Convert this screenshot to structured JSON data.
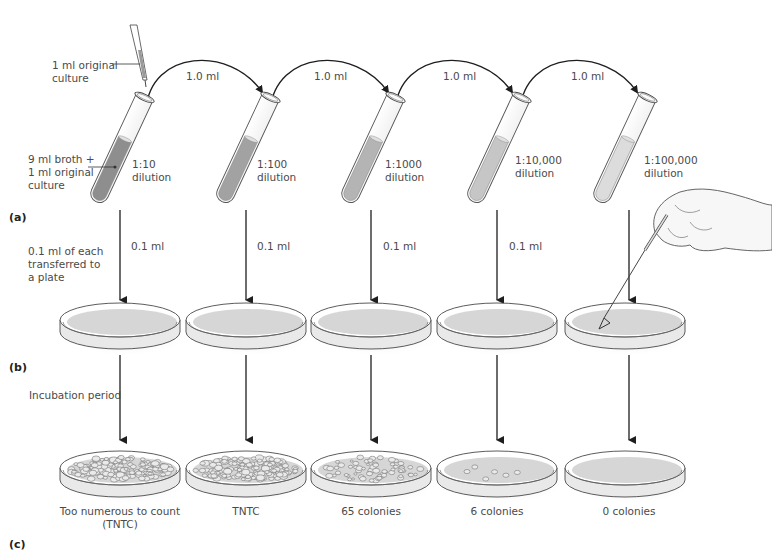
{
  "figure": {
    "parts": [
      "(a)",
      "(b)",
      "(c)"
    ],
    "pipette_label": "1 ml original\nculture",
    "first_tube_label": "9 ml broth +\n1 ml original\nculture",
    "transfer_label": "0.1 ml of each\ntransferred to\na plate",
    "incubation_label": "Incubation period",
    "transfer_volume": "1.0 ml",
    "plate_volume": "0.1 ml"
  },
  "tubes": [
    {
      "dilution": "1:10\ndilution",
      "fill": "#8e8e8e",
      "transfer": "1.0 ml",
      "plate_transfer": "0.1 ml"
    },
    {
      "dilution": "1:100\ndilution",
      "fill": "#a2a2a2",
      "transfer": "1.0 ml",
      "plate_transfer": "0.1 ml"
    },
    {
      "dilution": "1:1000\ndilution",
      "fill": "#b4b4b4",
      "transfer": "1.0 ml",
      "plate_transfer": "0.1 ml"
    },
    {
      "dilution": "1:10,000\ndilution",
      "fill": "#c6c6c6",
      "transfer": "1.0 ml",
      "plate_transfer": "0.1 ml"
    },
    {
      "dilution": "1:100,000\ndilution",
      "fill": "#dcdcdc",
      "plate_transfer": ""
    }
  ],
  "results": [
    {
      "label": "Too numerous to count\n(TNTC)",
      "colonies": "TNTC"
    },
    {
      "label": "TNTC",
      "colonies": "TNTC"
    },
    {
      "label": "65 colonies",
      "colonies": 65
    },
    {
      "label": "6 colonies",
      "colonies": 6
    },
    {
      "label": "0 colonies",
      "colonies": 0
    }
  ],
  "colors": {
    "line": "#1e1e1e",
    "agar": "#d6d6d6",
    "plate_rim": "#4a4a4a",
    "text": "#4a4a4a"
  }
}
